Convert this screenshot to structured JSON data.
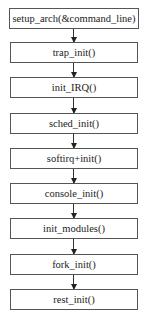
{
  "diagram": {
    "type": "flowchart",
    "direction": "top-to-bottom",
    "nodes": [
      {
        "id": "n1",
        "label": "setup_arch(&command_line)"
      },
      {
        "id": "n2",
        "label": "trap_init()"
      },
      {
        "id": "n3",
        "label": "init_IRQ()"
      },
      {
        "id": "n4",
        "label": "sched_init()"
      },
      {
        "id": "n5",
        "label": "softirq+init()"
      },
      {
        "id": "n6",
        "label": "console_init()"
      },
      {
        "id": "n7",
        "label": "init_modules()"
      },
      {
        "id": "n8",
        "label": "fork_init()"
      },
      {
        "id": "n9",
        "label": "rest_init()"
      }
    ],
    "edges": [
      {
        "from": "n1",
        "to": "n2"
      },
      {
        "from": "n2",
        "to": "n3"
      },
      {
        "from": "n3",
        "to": "n4"
      },
      {
        "from": "n4",
        "to": "n5"
      },
      {
        "from": "n5",
        "to": "n6"
      },
      {
        "from": "n6",
        "to": "n7"
      },
      {
        "from": "n7",
        "to": "n8"
      },
      {
        "from": "n8",
        "to": "n9"
      }
    ]
  }
}
